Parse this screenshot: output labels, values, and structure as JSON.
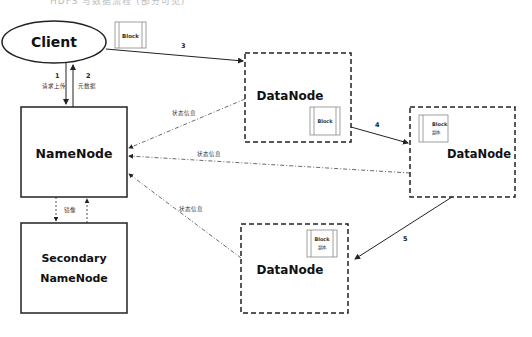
{
  "header": {
    "cut_text": "HDFS 写数据流程 (部分可见)"
  },
  "nodes": {
    "client": {
      "label": "Client"
    },
    "namenode": {
      "label": "NameNode"
    },
    "secondary": {
      "line1": "Secondary",
      "line2": "NameNode"
    },
    "datanode1": {
      "label": "DataNode",
      "block_label": "Block"
    },
    "datanode2": {
      "label": "DataNode",
      "block_label": "Block",
      "block_sub": "副本"
    },
    "datanode3": {
      "label": "DataNode",
      "block_label": "Block",
      "block_sub": "副本"
    }
  },
  "client_block": {
    "label": "Block"
  },
  "edges": {
    "step1": {
      "num": "1",
      "text": "请求上传"
    },
    "step2": {
      "num": "2",
      "text": "元数据"
    },
    "step3": {
      "num": "3"
    },
    "step4": {
      "num": "4"
    },
    "step5": {
      "num": "5"
    },
    "status1": {
      "text": "状态信息"
    },
    "status2": {
      "text": "状态信息"
    },
    "status3": {
      "text": "状态信息"
    },
    "mirror": {
      "text": "镜像"
    }
  }
}
